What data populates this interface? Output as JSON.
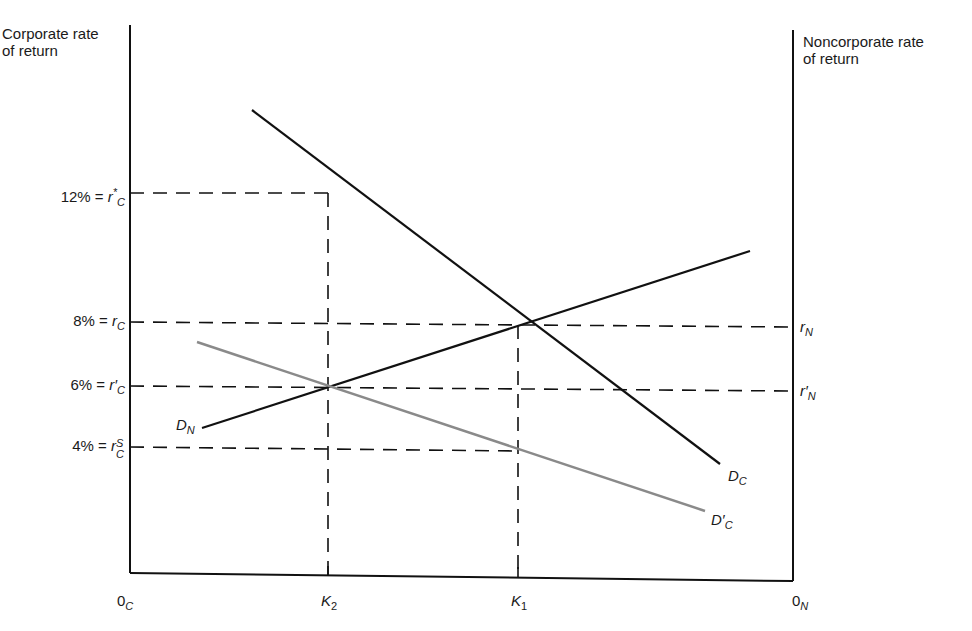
{
  "diagram": {
    "left_axis": {
      "title_line1": "Corporate rate",
      "title_line2": "of return",
      "origin": "0",
      "origin_sub": "C"
    },
    "right_axis": {
      "title_line1": "Noncorporate rate",
      "title_line2": "of return",
      "origin": "0",
      "origin_sub": "N"
    },
    "y_labels": [
      {
        "pct": "12% = ",
        "sym": "r",
        "sup": "*",
        "sub": "C",
        "y": 193
      },
      {
        "pct": "8% = ",
        "sym": "r",
        "sup": "",
        "sub": "C",
        "y": 322
      },
      {
        "pct": "6% = ",
        "sym": "r",
        "sup": "′",
        "sub": "C",
        "y": 386
      },
      {
        "pct": "4% = ",
        "sym": "r",
        "sup": "S",
        "sub": "C",
        "y": 447
      }
    ],
    "right_labels": [
      {
        "sym": "r",
        "prime": "",
        "sub": "N",
        "y": 327
      },
      {
        "sym": "r",
        "prime": "′",
        "sub": "N",
        "y": 391
      }
    ],
    "x_labels": [
      {
        "sym": "K",
        "sub": "2",
        "x": 328
      },
      {
        "sym": "K",
        "sub": "1",
        "x": 518
      }
    ],
    "curves": [
      {
        "name": "D",
        "sub": "C",
        "prime": "",
        "color": "#111111",
        "x1": 252,
        "y1": 110,
        "x2": 720,
        "y2": 464
      },
      {
        "name": "D",
        "sub": "N",
        "prime": "",
        "color": "#111111",
        "x1": 202,
        "y1": 428,
        "x2": 750,
        "y2": 251
      },
      {
        "name": "D",
        "sub": "C",
        "prime": "′",
        "color": "#8a8a8a",
        "x1": 197,
        "y1": 342,
        "x2": 705,
        "y2": 511
      }
    ],
    "colors": {
      "ink": "#111111",
      "gray_curve": "#8a8a8a",
      "background": "#ffffff"
    }
  }
}
